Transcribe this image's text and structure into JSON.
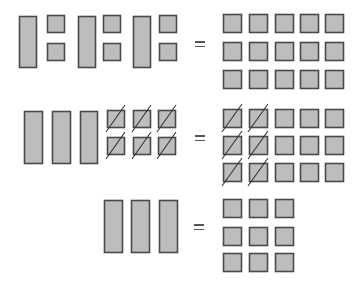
{
  "colors": {
    "fill": "#bdbdbd",
    "stroke": "#4a4a4a",
    "slash": "#333333"
  },
  "equations": [
    {
      "id": "row1",
      "left": {
        "longs": [
          {
            "x": 19,
            "y": 16,
            "w": 17,
            "h": 51
          },
          {
            "x": 78,
            "y": 16,
            "w": 17,
            "h": 51
          },
          {
            "x": 133,
            "y": 16,
            "w": 17,
            "h": 51
          }
        ],
        "units": [
          {
            "x": 47,
            "y": 15,
            "s": 17,
            "slashed": false
          },
          {
            "x": 47,
            "y": 43,
            "s": 17,
            "slashed": false
          },
          {
            "x": 103,
            "y": 15,
            "s": 17,
            "slashed": false
          },
          {
            "x": 103,
            "y": 43,
            "s": 17,
            "slashed": false
          },
          {
            "x": 159,
            "y": 15,
            "s": 17,
            "slashed": false
          },
          {
            "x": 159,
            "y": 43,
            "s": 17,
            "slashed": false
          }
        ]
      },
      "equals": {
        "x": 195,
        "y": 41
      },
      "right": {
        "cols": [
          223,
          249,
          275,
          300,
          325
        ],
        "rows": [
          14,
          42,
          70
        ],
        "s": 18,
        "slashed_cols": []
      }
    },
    {
      "id": "row2",
      "left": {
        "longs": [
          {
            "x": 24,
            "y": 111,
            "w": 18,
            "h": 52
          },
          {
            "x": 52,
            "y": 111,
            "w": 18,
            "h": 52
          },
          {
            "x": 80,
            "y": 111,
            "w": 17,
            "h": 52
          }
        ],
        "units": [
          {
            "x": 107,
            "y": 110,
            "s": 17,
            "slashed": true
          },
          {
            "x": 133,
            "y": 110,
            "s": 17,
            "slashed": true
          },
          {
            "x": 158,
            "y": 110,
            "s": 17,
            "slashed": true
          },
          {
            "x": 107,
            "y": 137,
            "s": 17,
            "slashed": true
          },
          {
            "x": 133,
            "y": 137,
            "s": 17,
            "slashed": true
          },
          {
            "x": 158,
            "y": 137,
            "s": 17,
            "slashed": true
          }
        ]
      },
      "equals": {
        "x": 195,
        "y": 135
      },
      "right": {
        "cols": [
          223,
          249,
          275,
          300,
          325
        ],
        "rows": [
          109,
          136,
          163
        ],
        "s": 18,
        "slashed_cols": [
          0,
          1
        ]
      }
    },
    {
      "id": "row3",
      "left": {
        "longs": [
          {
            "x": 104,
            "y": 200,
            "w": 18,
            "h": 52
          },
          {
            "x": 131,
            "y": 200,
            "w": 18,
            "h": 52
          },
          {
            "x": 159,
            "y": 200,
            "w": 18,
            "h": 52
          }
        ],
        "units": []
      },
      "equals": {
        "x": 194,
        "y": 224
      },
      "right": {
        "cols": [
          223,
          249,
          275
        ],
        "rows": [
          199,
          227,
          253
        ],
        "s": 18,
        "slashed_cols": []
      }
    }
  ]
}
